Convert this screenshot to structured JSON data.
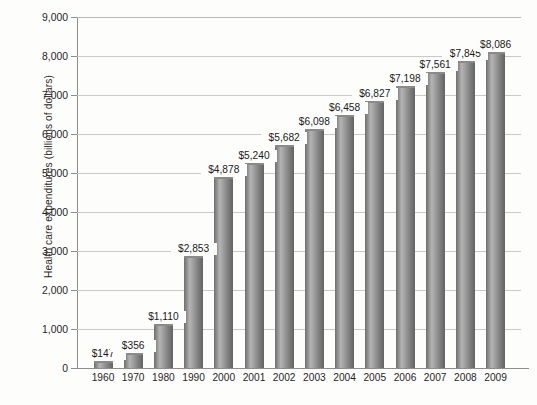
{
  "chart_data": {
    "type": "bar",
    "title": "",
    "xlabel": "",
    "ylabel": "Health care expenditures (billions of dollars)",
    "categories": [
      "1960",
      "1970",
      "1980",
      "1990",
      "2000",
      "2001",
      "2002",
      "2003",
      "2004",
      "2005",
      "2006",
      "2007",
      "2008",
      "2009"
    ],
    "values": [
      147,
      356,
      1110,
      2853,
      4878,
      5240,
      5682,
      6098,
      6458,
      6827,
      7198,
      7561,
      7845,
      8086
    ],
    "data_labels": [
      "$147",
      "$356",
      "$1,110",
      "$2,853",
      "$4,878",
      "$5,240",
      "$5,682",
      "$6,098",
      "$6,458",
      "$6,827",
      "$7,198",
      "$7,561",
      "$7,845",
      "$8,086"
    ],
    "ylim": [
      0,
      9000
    ],
    "ytick_values": [
      0,
      1000,
      2000,
      3000,
      4000,
      5000,
      6000,
      7000,
      8000,
      9000
    ],
    "ytick_labels": [
      "0",
      "1,000",
      "2,000",
      "3,000",
      "4,000",
      "5,000",
      "6,000",
      "7,000",
      "8,000",
      "9,000"
    ],
    "grid": true,
    "legend": "none",
    "bar_color": "#8e8e8e",
    "grid_color": "#c9c9c9",
    "axis_color": "#8d8d8d",
    "background_color": "#fdfdfc"
  }
}
